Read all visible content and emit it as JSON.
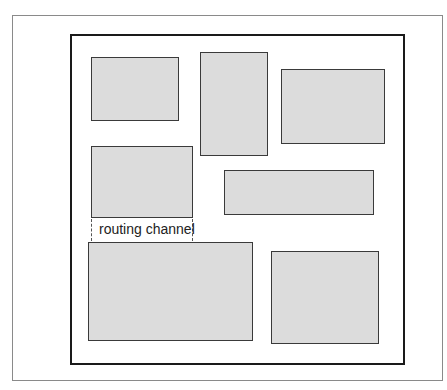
{
  "diagram": {
    "title": "",
    "blocks": [
      {
        "id": "block-1"
      },
      {
        "id": "block-2"
      },
      {
        "id": "block-3"
      },
      {
        "id": "block-4"
      },
      {
        "id": "block-5"
      },
      {
        "id": "block-6"
      },
      {
        "id": "block-7"
      }
    ],
    "annotation": {
      "text": "routing channel",
      "between": [
        "block-4",
        "block-6"
      ]
    },
    "colors": {
      "block_fill": "#dcdcdc",
      "block_border": "#3a3a3a",
      "chip_border": "#1a1a1a",
      "frame_border": "#8a8a8a"
    }
  }
}
